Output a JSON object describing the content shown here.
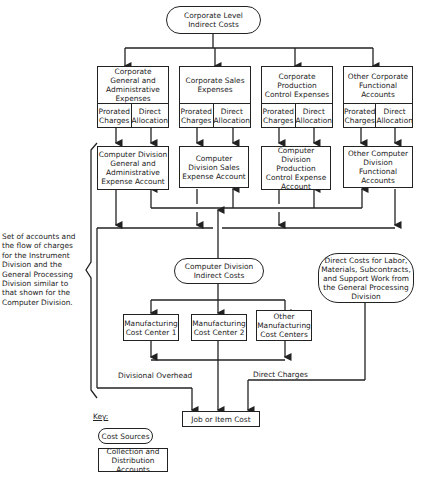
{
  "top": {
    "label": "Corporate Level\nIndirect Costs"
  },
  "corporate_accounts": [
    {
      "title": "Corporate General and Administrative Expenses",
      "left": "Prorated Charges",
      "right": "Direct Allocation"
    },
    {
      "title": "Corporate Sales Expenses",
      "left": "Prorated Charges",
      "right": "Direct Allocation"
    },
    {
      "title": "Corporate Production Control Expenses",
      "left": "Prorated Charges",
      "right": "Direct Allocation"
    },
    {
      "title": "Other Corporate Functional Accounts",
      "left": "Prorated Charges",
      "right": "Direct Allocation"
    }
  ],
  "division_accounts": [
    {
      "title": "Computer Division General and Administrative Expense Account"
    },
    {
      "title": "Computer Division Sales Expense Account"
    },
    {
      "title": "Computer Division Production Control Expense Account"
    },
    {
      "title": "Other Computer Division Functional Accounts"
    }
  ],
  "side_note": "Set of accounts and\nthe flow of charges\nfor the Instrument\nDivision and the\nGeneral Processing\nDivision similar to\nthat shown for the\nComputer Division.",
  "division_indirect": {
    "label": "Computer Division Indirect Costs"
  },
  "direct_costs": {
    "label": "Direct Costs for Labor, Materials, Subcontracts, and Support Work from the General Processing Division"
  },
  "cost_centers": [
    {
      "label": "Manufacturing Cost Center 1"
    },
    {
      "label": "Manufacturing Cost Center 2"
    },
    {
      "label": "Other Manufacturing Cost Centers"
    }
  ],
  "flow_labels": {
    "overhead": "Divisional Overhead",
    "direct": "Direct Charges"
  },
  "job_cost": {
    "label": "Job or Item Cost"
  },
  "key": {
    "title": "Key:",
    "oval": "Cost Sources",
    "rect": "Collection and Distribution Accounts"
  }
}
